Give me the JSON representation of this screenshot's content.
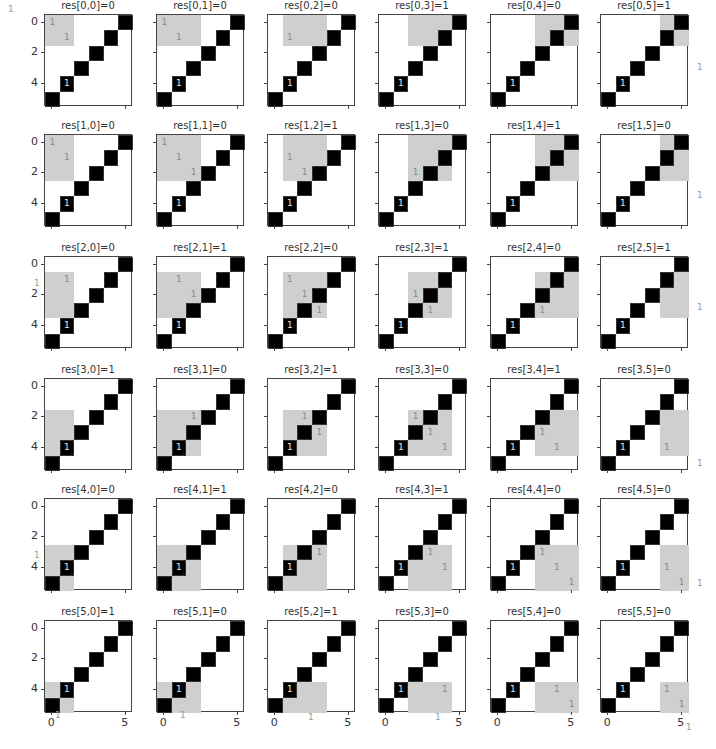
{
  "chart_data": {
    "type": "heatmap",
    "layout": "6x6 grid of subplots",
    "matrix_size": 6,
    "base_matrix_black_cells": [
      [
        0,
        5
      ],
      [
        1,
        4
      ],
      [
        2,
        3
      ],
      [
        3,
        2
      ],
      [
        4,
        1
      ],
      [
        5,
        0
      ]
    ],
    "always_labeled_cell": [
      4,
      1
    ],
    "yticks": [
      "0",
      "2",
      "4"
    ],
    "xticks": [
      "0",
      "5"
    ],
    "annotation_value": "1",
    "colors": {
      "black_cell": "#000000",
      "window": "#cfcfcf",
      "background": "#ffffff",
      "label_on_black": "#e8e8e8",
      "label_on_gray": "#8a8a8a"
    },
    "panels": [
      [
        {
          "title": "res[0,0]=0",
          "value": 0
        },
        {
          "title": "res[0,1]=0",
          "value": 0
        },
        {
          "title": "res[0,2]=0",
          "value": 0
        },
        {
          "title": "res[0,3]=1",
          "value": 1
        },
        {
          "title": "res[0,4]=0",
          "value": 0
        },
        {
          "title": "res[0,5]=1",
          "value": 1
        }
      ],
      [
        {
          "title": "res[1,0]=0",
          "value": 0
        },
        {
          "title": "res[1,1]=0",
          "value": 0
        },
        {
          "title": "res[1,2]=1",
          "value": 1
        },
        {
          "title": "res[1,3]=0",
          "value": 0
        },
        {
          "title": "res[1,4]=1",
          "value": 1
        },
        {
          "title": "res[1,5]=0",
          "value": 0
        }
      ],
      [
        {
          "title": "res[2,0]=0",
          "value": 0
        },
        {
          "title": "res[2,1]=1",
          "value": 1
        },
        {
          "title": "res[2,2]=0",
          "value": 0
        },
        {
          "title": "res[2,3]=1",
          "value": 1
        },
        {
          "title": "res[2,4]=0",
          "value": 0
        },
        {
          "title": "res[2,5]=1",
          "value": 1
        }
      ],
      [
        {
          "title": "res[3,0]=1",
          "value": 1
        },
        {
          "title": "res[3,1]=0",
          "value": 0
        },
        {
          "title": "res[3,2]=1",
          "value": 1
        },
        {
          "title": "res[3,3]=0",
          "value": 0
        },
        {
          "title": "res[3,4]=1",
          "value": 1
        },
        {
          "title": "res[3,5]=0",
          "value": 0
        }
      ],
      [
        {
          "title": "res[4,0]=0",
          "value": 0
        },
        {
          "title": "res[4,1]=1",
          "value": 1
        },
        {
          "title": "res[4,2]=0",
          "value": 0
        },
        {
          "title": "res[4,3]=1",
          "value": 1
        },
        {
          "title": "res[4,4]=0",
          "value": 0
        },
        {
          "title": "res[4,5]=0",
          "value": 0
        }
      ],
      [
        {
          "title": "res[5,0]=1",
          "value": 1
        },
        {
          "title": "res[5,1]=0",
          "value": 0
        },
        {
          "title": "res[5,2]=1",
          "value": 1
        },
        {
          "title": "res[5,3]=0",
          "value": 0
        },
        {
          "title": "res[5,4]=0",
          "value": 0
        },
        {
          "title": "res[5,5]=0",
          "value": 0
        }
      ]
    ],
    "result_matrix": [
      [
        0,
        0,
        0,
        1,
        0,
        1
      ],
      [
        0,
        0,
        1,
        0,
        1,
        0
      ],
      [
        0,
        1,
        0,
        1,
        0,
        1
      ],
      [
        1,
        0,
        1,
        0,
        1,
        0
      ],
      [
        0,
        1,
        0,
        1,
        0,
        0
      ],
      [
        1,
        0,
        1,
        0,
        0,
        0
      ]
    ],
    "window": "3x3 neighborhood centered at (i,j), clipped to matrix bounds"
  },
  "stray_labels": [
    {
      "text": "1",
      "x": 8,
      "y": 4
    },
    {
      "text": "1",
      "x": 697,
      "y": 62
    },
    {
      "text": "1",
      "x": 697,
      "y": 190
    },
    {
      "text": "1",
      "x": 697,
      "y": 302
    },
    {
      "text": "1",
      "x": 697,
      "y": 458
    },
    {
      "text": "1",
      "x": 697,
      "y": 578
    },
    {
      "text": "1",
      "x": 55,
      "y": 710
    },
    {
      "text": "1",
      "x": 180,
      "y": 710
    },
    {
      "text": "1",
      "x": 308,
      "y": 712
    },
    {
      "text": "1",
      "x": 435,
      "y": 712
    },
    {
      "text": "1",
      "x": 686,
      "y": 722
    },
    {
      "text": "1",
      "x": 34,
      "y": 278
    },
    {
      "text": "1",
      "x": 34,
      "y": 550
    }
  ]
}
